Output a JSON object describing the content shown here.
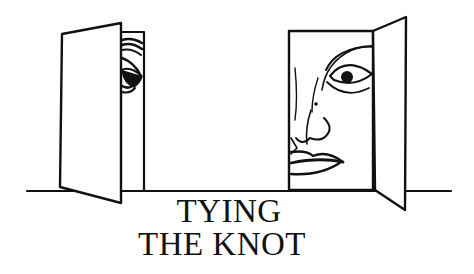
{
  "illustration": {
    "description": "Two open doors with faces peeking out",
    "left_door": {
      "figure": "eye peeking from behind door"
    },
    "right_door": {
      "figure": "half face (eye, nose, lips) in doorway"
    },
    "line_color": "#111111",
    "background": "#ffffff"
  },
  "caption": {
    "line1": "TYING",
    "line2": "THE KNOT"
  }
}
